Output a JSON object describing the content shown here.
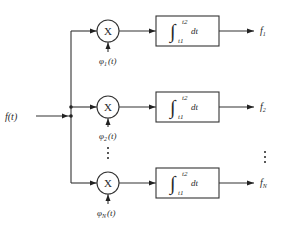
{
  "diagram": {
    "type": "block-diagram",
    "input": {
      "label": "f(t)"
    },
    "multiplier_symbol": "X",
    "integrator": {
      "symbol": "∫",
      "upper_limit": "t2",
      "lower_limit": "t1",
      "differential": "dt"
    },
    "branches": [
      {
        "id": "1",
        "basis_label": "φ",
        "basis_sub": "1",
        "basis_arg": "(t)",
        "output_label": "f",
        "output_sub": "1"
      },
      {
        "id": "2",
        "basis_label": "φ",
        "basis_sub": "2",
        "basis_arg": "(t)",
        "output_label": "f",
        "output_sub": "2"
      },
      {
        "id": "N",
        "basis_label": "φ",
        "basis_sub": "N",
        "basis_arg": "(t)",
        "output_label": "f",
        "output_sub": "N"
      }
    ],
    "ellipsis": "⋮",
    "colors": {
      "line": "#333333",
      "text": "#2a2a2a",
      "background": "#ffffff"
    }
  }
}
